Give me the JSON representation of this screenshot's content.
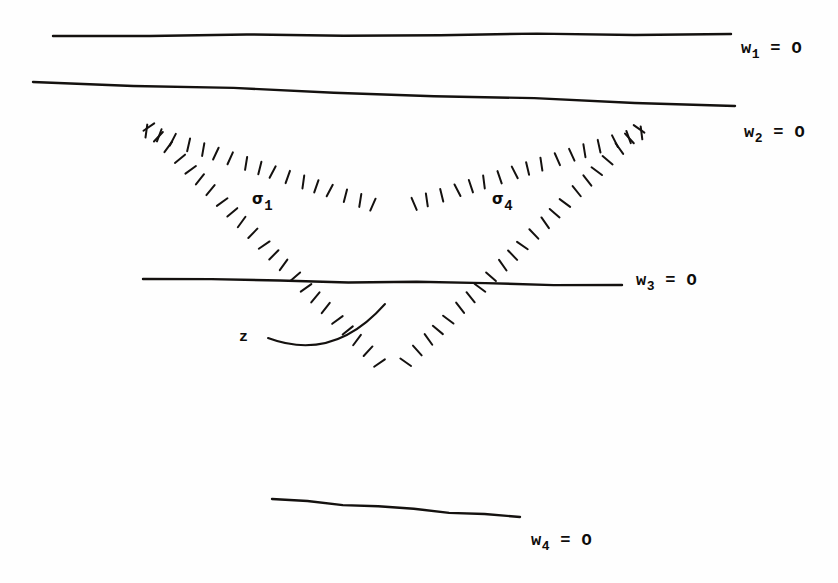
{
  "figure": {
    "background_color": "#fefefe",
    "ink_color": "#14110f",
    "labels": {
      "w1": {
        "symbol": "w",
        "sub": "1",
        "rest": " = O",
        "x": 741,
        "y": 40
      },
      "w2": {
        "symbol": "w",
        "sub": "2",
        "rest": " = O",
        "x": 744,
        "y": 124
      },
      "w3": {
        "symbol": "w",
        "sub": "3",
        "rest": " = O",
        "x": 636,
        "y": 272
      },
      "w4": {
        "symbol": "w",
        "sub": "4",
        "rest": " = O",
        "x": 531,
        "y": 532
      },
      "sigma1": {
        "symbol": "σ",
        "sub": "1",
        "rest": "",
        "x": 252,
        "y": 192
      },
      "sigma4": {
        "symbol": "σ",
        "sub": "4",
        "rest": "",
        "x": 492,
        "y": 192
      },
      "z": {
        "symbol": "z",
        "sub": "",
        "rest": "",
        "x": 239,
        "y": 330
      }
    },
    "lines": [
      {
        "name": "w1-line",
        "x1": 53,
        "y1": 36,
        "x2": 731,
        "y2": 34
      },
      {
        "name": "w2-line",
        "x1": 33,
        "y1": 82,
        "x2": 735,
        "y2": 106
      },
      {
        "name": "w3-line",
        "x1": 143,
        "y1": 279,
        "x2": 622,
        "y2": 285
      },
      {
        "name": "w4-line",
        "x1": 272,
        "y1": 499,
        "x2": 520,
        "y2": 517
      }
    ],
    "vertices": {
      "left_crossing": {
        "x": 133,
        "y": 120
      },
      "right_crossing": {
        "x": 655,
        "y": 122
      },
      "center_apex": {
        "x": 392,
        "y": 204
      },
      "bottom_apex": {
        "x": 392,
        "y": 385
      }
    },
    "hatched_edges": [
      {
        "name": "sigma1-upper-edge",
        "from": "left_crossing",
        "to": "center_apex",
        "tick_side": "below"
      },
      {
        "name": "sigma1-lower-edge",
        "from": "left_crossing",
        "to": "bottom_apex",
        "tick_side": "right"
      },
      {
        "name": "sigma4-upper-edge",
        "from": "right_crossing",
        "to": "center_apex",
        "tick_side": "below"
      },
      {
        "name": "sigma4-lower-edge",
        "from": "right_crossing",
        "to": "bottom_apex",
        "tick_side": "left"
      }
    ],
    "arrow": {
      "name": "z-pointer",
      "description": "curved arc from z label sweeping right then up past hatched edge",
      "start": {
        "x": 268,
        "y": 338
      },
      "end": {
        "x": 385,
        "y": 304
      }
    }
  }
}
